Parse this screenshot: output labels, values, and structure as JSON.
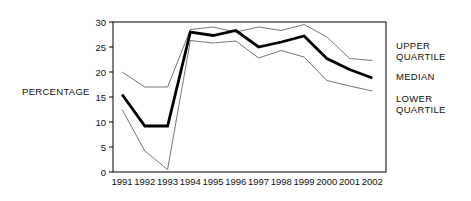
{
  "chart_data": {
    "type": "line",
    "title": "",
    "xlabel": "",
    "ylabel": "PERCENTAGE",
    "categories": [
      "1991",
      "1992",
      "1993",
      "1994",
      "1995",
      "1996",
      "1997",
      "1998",
      "1999",
      "2000",
      "2001",
      "2002"
    ],
    "ylim": [
      0,
      30
    ],
    "yticks": [
      0,
      5,
      10,
      15,
      20,
      25,
      30
    ],
    "ytick_labels": [
      "0",
      "5",
      "10",
      "15",
      "20",
      "25",
      "30"
    ],
    "grid": false,
    "legend_position": "right-inline",
    "series": [
      {
        "name": "UPPER QUARTILE",
        "style": "thin",
        "color": "#666666",
        "values": [
          20.0,
          17.0,
          17.0,
          28.5,
          29.0,
          28.0,
          29.0,
          28.3,
          29.5,
          27.0,
          22.7,
          22.3
        ]
      },
      {
        "name": "MEDIAN",
        "style": "thick",
        "color": "#000000",
        "values": [
          15.5,
          9.2,
          9.2,
          28.0,
          27.3,
          28.3,
          25.0,
          26.0,
          27.2,
          22.7,
          20.5,
          18.8
        ]
      },
      {
        "name": "LOWER QUARTILE",
        "style": "thin",
        "color": "#666666",
        "values": [
          12.5,
          4.2,
          0.5,
          26.3,
          25.8,
          26.2,
          22.8,
          24.3,
          23.0,
          18.3,
          17.2,
          16.2
        ]
      }
    ]
  },
  "axis": {
    "y_title": "PERCENTAGE"
  },
  "legend": {
    "upper_line1": "UPPER",
    "upper_line2": "QUARTILE",
    "median": "MEDIAN",
    "lower_line1": "LOWER",
    "lower_line2": "QUARTILE"
  },
  "colors": {
    "background": "#ffffff",
    "axis": "#000000",
    "thin_line": "#666666",
    "thick_line": "#000000",
    "text": "#111111"
  }
}
